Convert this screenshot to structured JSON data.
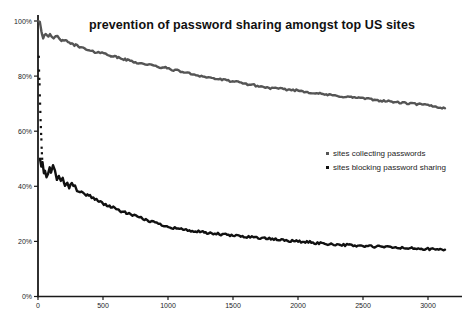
{
  "chart_data": {
    "type": "line",
    "title": "prevention of password sharing amongst top US sites",
    "xlabel": "",
    "ylabel": "",
    "xlim": [
      0,
      3260
    ],
    "ylim": [
      0,
      100
    ],
    "grid": false,
    "legend_position": "center-right",
    "x_ticks": [
      0,
      500,
      1000,
      1500,
      2000,
      2500,
      3000
    ],
    "y_ticks": [
      [
        0,
        "0%"
      ],
      [
        20,
        "20%"
      ],
      [
        40,
        "40%"
      ],
      [
        60,
        "60%"
      ],
      [
        80,
        "80%"
      ],
      [
        100,
        "100%"
      ]
    ],
    "series": [
      {
        "name": "sites collecting passwords",
        "color": "#555555",
        "noise": 0.35,
        "points": [
          [
            2,
            100
          ],
          [
            8,
            100
          ],
          [
            14,
            100
          ],
          [
            20,
            98
          ],
          [
            26,
            96.5
          ],
          [
            32,
            95
          ],
          [
            40,
            94
          ],
          [
            50,
            95
          ],
          [
            60,
            95.5
          ],
          [
            70,
            94.5
          ],
          [
            80,
            94
          ],
          [
            92,
            95
          ],
          [
            105,
            94.3
          ],
          [
            120,
            93.6
          ],
          [
            135,
            94.2
          ],
          [
            150,
            94.5
          ],
          [
            165,
            93.8
          ],
          [
            180,
            93
          ],
          [
            200,
            92.6
          ],
          [
            220,
            92.9
          ],
          [
            240,
            92.2
          ],
          [
            260,
            91.6
          ],
          [
            280,
            91.2
          ],
          [
            300,
            91.4
          ],
          [
            320,
            90.7
          ],
          [
            340,
            90.2
          ],
          [
            360,
            89.9
          ],
          [
            380,
            89.4
          ],
          [
            400,
            89.1
          ],
          [
            420,
            88.9
          ],
          [
            440,
            88.7
          ],
          [
            465,
            88.8
          ],
          [
            492,
            88.4
          ],
          [
            520,
            88
          ],
          [
            550,
            87.6
          ],
          [
            580,
            87.2
          ],
          [
            610,
            86.8
          ],
          [
            640,
            86.4
          ],
          [
            670,
            86
          ],
          [
            700,
            85.7
          ],
          [
            730,
            85.3
          ],
          [
            760,
            84.9
          ],
          [
            800,
            84.5
          ],
          [
            840,
            84.3
          ],
          [
            880,
            83.8
          ],
          [
            920,
            83.4
          ],
          [
            960,
            83.1
          ],
          [
            992,
            82.9
          ],
          [
            1030,
            82.4
          ],
          [
            1070,
            82
          ],
          [
            1110,
            81.6
          ],
          [
            1150,
            81.1
          ],
          [
            1190,
            80.7
          ],
          [
            1230,
            80.3
          ],
          [
            1270,
            79.9
          ],
          [
            1310,
            79.5
          ],
          [
            1350,
            79.2
          ],
          [
            1390,
            78.9
          ],
          [
            1440,
            78.5
          ],
          [
            1500,
            78.1
          ],
          [
            1550,
            77.6
          ],
          [
            1600,
            77.2
          ],
          [
            1650,
            76.8
          ],
          [
            1700,
            76.3
          ],
          [
            1750,
            75.9
          ],
          [
            1800,
            75.6
          ],
          [
            1850,
            75.4
          ],
          [
            1900,
            75.2
          ],
          [
            1950,
            75
          ],
          [
            2000,
            74.8
          ],
          [
            2060,
            74.3
          ],
          [
            2120,
            73.9
          ],
          [
            2180,
            73.5
          ],
          [
            2240,
            73.1
          ],
          [
            2300,
            72.8
          ],
          [
            2360,
            72.5
          ],
          [
            2420,
            72.3
          ],
          [
            2480,
            72.1
          ],
          [
            2540,
            71.7
          ],
          [
            2600,
            71.3
          ],
          [
            2660,
            71
          ],
          [
            2720,
            70.7
          ],
          [
            2780,
            70.4
          ],
          [
            2840,
            70.1
          ],
          [
            2900,
            69.9
          ],
          [
            2950,
            69.7
          ],
          [
            3000,
            69.4
          ],
          [
            3060,
            68.9
          ],
          [
            3131,
            68.3
          ]
        ]
      },
      {
        "name": "sites blocking password sharing",
        "color": "#111111",
        "noise": 0.45,
        "intro_scatter": [
          [
            6,
            87
          ],
          [
            8,
            82
          ],
          [
            10,
            79
          ],
          [
            12,
            77
          ],
          [
            14,
            73
          ],
          [
            16,
            70
          ],
          [
            18,
            67
          ],
          [
            20,
            64
          ],
          [
            22,
            61.5
          ],
          [
            24,
            59
          ],
          [
            26,
            57
          ],
          [
            28,
            54
          ],
          [
            30,
            52
          ],
          [
            32,
            50
          ]
        ],
        "points": [
          [
            15,
            50
          ],
          [
            25,
            47
          ],
          [
            35,
            49
          ],
          [
            45,
            45
          ],
          [
            54,
            46
          ],
          [
            65,
            43
          ],
          [
            77,
            44
          ],
          [
            90,
            47
          ],
          [
            100,
            45
          ],
          [
            115,
            48
          ],
          [
            131,
            46
          ],
          [
            145,
            42
          ],
          [
            160,
            44
          ],
          [
            175,
            42
          ],
          [
            190,
            43
          ],
          [
            208,
            40
          ],
          [
            225,
            41.5
          ],
          [
            240,
            39.5
          ],
          [
            260,
            41
          ],
          [
            285,
            40
          ],
          [
            300,
            38.5
          ],
          [
            323,
            38
          ],
          [
            345,
            37.5
          ],
          [
            370,
            37
          ],
          [
            400,
            36.5
          ],
          [
            425,
            35.8
          ],
          [
            450,
            35.2
          ],
          [
            470,
            34.6
          ],
          [
            492,
            34
          ],
          [
            520,
            33.3
          ],
          [
            550,
            32.8
          ],
          [
            580,
            32.2
          ],
          [
            610,
            31.6
          ],
          [
            640,
            31
          ],
          [
            670,
            30.4
          ],
          [
            700,
            30
          ],
          [
            740,
            29.3
          ],
          [
            780,
            28.6
          ],
          [
            820,
            28
          ],
          [
            862,
            27.4
          ],
          [
            900,
            26.8
          ],
          [
            940,
            26.2
          ],
          [
            992,
            25.5
          ],
          [
            1040,
            25
          ],
          [
            1090,
            24.6
          ],
          [
            1140,
            24.1
          ],
          [
            1200,
            23.7
          ],
          [
            1246,
            23.4
          ],
          [
            1300,
            23
          ],
          [
            1360,
            22.8
          ],
          [
            1420,
            22.5
          ],
          [
            1500,
            22.1
          ],
          [
            1560,
            21.9
          ],
          [
            1620,
            21.7
          ],
          [
            1708,
            21.3
          ],
          [
            1780,
            20.9
          ],
          [
            1850,
            20.6
          ],
          [
            1920,
            20.3
          ],
          [
            2000,
            20
          ],
          [
            2080,
            19.7
          ],
          [
            2150,
            19.4
          ],
          [
            2230,
            19.1
          ],
          [
            2300,
            18.9
          ],
          [
            2400,
            18.6
          ],
          [
            2500,
            18.3
          ],
          [
            2600,
            18.1
          ],
          [
            2700,
            17.9
          ],
          [
            2800,
            17.6
          ],
          [
            2900,
            17.4
          ],
          [
            3000,
            17.2
          ],
          [
            3070,
            17.1
          ],
          [
            3131,
            17
          ]
        ]
      }
    ],
    "axis_color": "#1a1a1a",
    "background_color": "#ffffff"
  }
}
